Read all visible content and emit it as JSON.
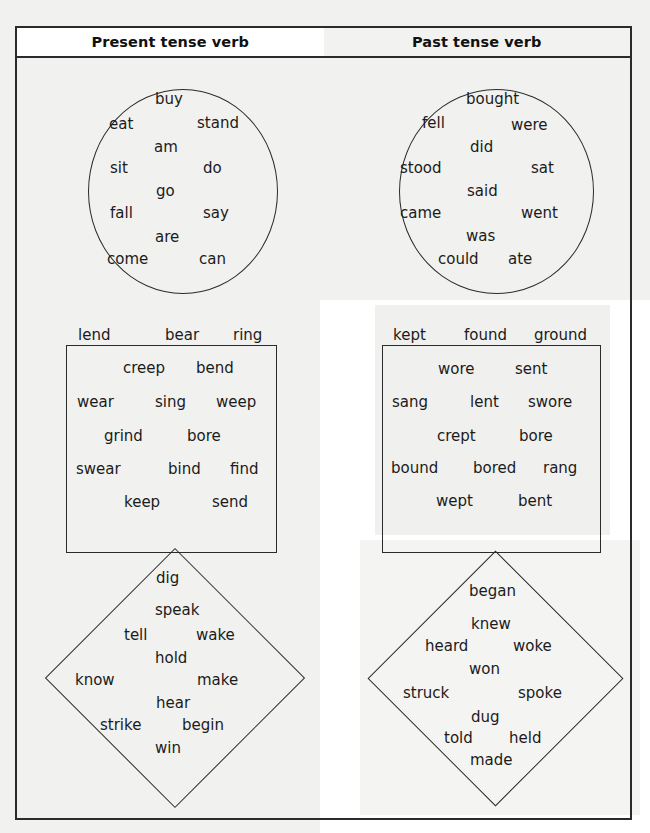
{
  "page": {
    "title_columns": [
      "Present tense verb",
      "Past tense verb"
    ],
    "ink_color": "#2b2b2b",
    "text_color": "#1b1b1b",
    "tint_color": "#f1f1ef"
  },
  "header": {
    "present_label": "Present tense verb",
    "past_label": "Past tense verb"
  },
  "groups": [
    {
      "shape": "circle",
      "column": "present",
      "words": [
        {
          "text": "buy",
          "x": 155,
          "y": 92
        },
        {
          "text": "eat",
          "x": 109,
          "y": 117
        },
        {
          "text": "stand",
          "x": 197,
          "y": 116
        },
        {
          "text": "am",
          "x": 154,
          "y": 140
        },
        {
          "text": "sit",
          "x": 110,
          "y": 161
        },
        {
          "text": "do",
          "x": 203,
          "y": 161
        },
        {
          "text": "go",
          "x": 156,
          "y": 184
        },
        {
          "text": "fall",
          "x": 110,
          "y": 206
        },
        {
          "text": "say",
          "x": 203,
          "y": 206
        },
        {
          "text": "are",
          "x": 155,
          "y": 230
        },
        {
          "text": "come",
          "x": 107,
          "y": 252
        },
        {
          "text": "can",
          "x": 199,
          "y": 252
        }
      ]
    },
    {
      "shape": "circle",
      "column": "past",
      "words": [
        {
          "text": "bought",
          "x": 466,
          "y": 92
        },
        {
          "text": "fell",
          "x": 422,
          "y": 116
        },
        {
          "text": "were",
          "x": 511,
          "y": 118
        },
        {
          "text": "did",
          "x": 470,
          "y": 140
        },
        {
          "text": "stood",
          "x": 400,
          "y": 161
        },
        {
          "text": "sat",
          "x": 531,
          "y": 161
        },
        {
          "text": "said",
          "x": 467,
          "y": 184
        },
        {
          "text": "came",
          "x": 400,
          "y": 206
        },
        {
          "text": "went",
          "x": 521,
          "y": 206
        },
        {
          "text": "was",
          "x": 466,
          "y": 229
        },
        {
          "text": "could",
          "x": 438,
          "y": 252
        },
        {
          "text": "ate",
          "x": 508,
          "y": 252
        }
      ]
    },
    {
      "shape": "rectangle",
      "column": "present",
      "words": [
        {
          "text": "creep",
          "x": 123,
          "y": 361
        },
        {
          "text": "bend",
          "x": 196,
          "y": 361
        },
        {
          "text": "lend",
          "x": 78,
          "y": 328
        },
        {
          "text": "bear",
          "x": 165,
          "y": 328
        },
        {
          "text": "ring",
          "x": 233,
          "y": 328
        },
        {
          "text": "wear",
          "x": 77,
          "y": 395
        },
        {
          "text": "sing",
          "x": 155,
          "y": 395
        },
        {
          "text": "weep",
          "x": 216,
          "y": 395
        },
        {
          "text": "grind",
          "x": 104,
          "y": 429
        },
        {
          "text": "bore",
          "x": 187,
          "y": 429
        },
        {
          "text": "swear",
          "x": 76,
          "y": 462
        },
        {
          "text": "bind",
          "x": 168,
          "y": 462
        },
        {
          "text": "find",
          "x": 230,
          "y": 462
        },
        {
          "text": "keep",
          "x": 124,
          "y": 495
        },
        {
          "text": "send",
          "x": 212,
          "y": 495
        }
      ]
    },
    {
      "shape": "rectangle",
      "column": "past",
      "words": [
        {
          "text": "kept",
          "x": 393,
          "y": 328
        },
        {
          "text": "found",
          "x": 464,
          "y": 328
        },
        {
          "text": "ground",
          "x": 534,
          "y": 328
        },
        {
          "text": "wore",
          "x": 438,
          "y": 362
        },
        {
          "text": "sent",
          "x": 515,
          "y": 362
        },
        {
          "text": "sang",
          "x": 392,
          "y": 395
        },
        {
          "text": "lent",
          "x": 470,
          "y": 395
        },
        {
          "text": "swore",
          "x": 528,
          "y": 395
        },
        {
          "text": "crept",
          "x": 437,
          "y": 429
        },
        {
          "text": "bore",
          "x": 519,
          "y": 429
        },
        {
          "text": "bound",
          "x": 391,
          "y": 461
        },
        {
          "text": "bored",
          "x": 473,
          "y": 461
        },
        {
          "text": "rang",
          "x": 543,
          "y": 461
        },
        {
          "text": "wept",
          "x": 436,
          "y": 494
        },
        {
          "text": "bent",
          "x": 518,
          "y": 494
        }
      ]
    },
    {
      "shape": "diamond",
      "column": "present",
      "words": [
        {
          "text": "dig",
          "x": 156,
          "y": 571
        },
        {
          "text": "speak",
          "x": 155,
          "y": 603
        },
        {
          "text": "tell",
          "x": 124,
          "y": 628
        },
        {
          "text": "wake",
          "x": 196,
          "y": 628
        },
        {
          "text": "hold",
          "x": 155,
          "y": 651
        },
        {
          "text": "know",
          "x": 75,
          "y": 673
        },
        {
          "text": "make",
          "x": 197,
          "y": 673
        },
        {
          "text": "hear",
          "x": 156,
          "y": 696
        },
        {
          "text": "strike",
          "x": 100,
          "y": 718
        },
        {
          "text": "begin",
          "x": 182,
          "y": 718
        },
        {
          "text": "win",
          "x": 155,
          "y": 741
        }
      ]
    },
    {
      "shape": "diamond",
      "column": "past",
      "words": [
        {
          "text": "began",
          "x": 469,
          "y": 584
        },
        {
          "text": "knew",
          "x": 471,
          "y": 617
        },
        {
          "text": "heard",
          "x": 425,
          "y": 639
        },
        {
          "text": "woke",
          "x": 513,
          "y": 639
        },
        {
          "text": "won",
          "x": 469,
          "y": 662
        },
        {
          "text": "struck",
          "x": 403,
          "y": 686
        },
        {
          "text": "spoke",
          "x": 518,
          "y": 686
        },
        {
          "text": "dug",
          "x": 471,
          "y": 710
        },
        {
          "text": "told",
          "x": 444,
          "y": 731
        },
        {
          "text": "held",
          "x": 509,
          "y": 731
        },
        {
          "text": "made",
          "x": 470,
          "y": 753
        }
      ]
    }
  ]
}
